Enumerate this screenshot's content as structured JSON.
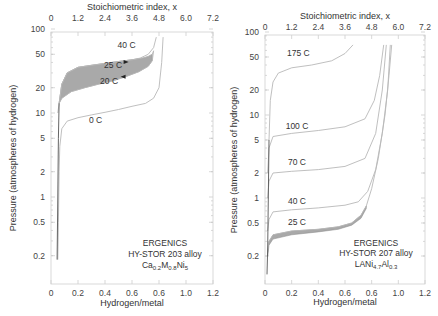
{
  "chart_data": [
    {
      "type": "line",
      "id": "left",
      "title": "",
      "top_xlabel": "Stoichiometric index, x",
      "top_xticks": [
        "0",
        "1.2",
        "2.4",
        "3.6",
        "4.8",
        "6.0",
        "7.2"
      ],
      "xlabel": "Hydrogen/metal",
      "xticks": [
        "0",
        "0.2",
        "0.4",
        "0.6",
        "0.6",
        "1.0",
        "1.2"
      ],
      "ylabel": "Pressure  (atmospheres of hydrogen)",
      "yticks": [
        "100",
        "50",
        "20",
        "10",
        "5",
        "2",
        "1",
        "0.5",
        "0.2"
      ],
      "yscale": "log",
      "xlim": [
        0,
        1.2
      ],
      "ylim": [
        0.1,
        100
      ],
      "annotation": {
        "line1": "ERGENICS",
        "line2": "HY-STOR 203 alloy",
        "formula": [
          {
            "t": "Ca",
            "sub": false
          },
          {
            "t": "0.2",
            "sub": true
          },
          {
            "t": "M",
            "sub": false
          },
          {
            "t": "0.8",
            "sub": true
          },
          {
            "t": "Ni",
            "sub": false
          },
          {
            "t": "5",
            "sub": true
          }
        ]
      },
      "series": [
        {
          "name": "40 C",
          "label_at": [
            0.56,
            60
          ],
          "points": [
            [
              0.06,
              13
            ],
            [
              0.08,
              22
            ],
            [
              0.12,
              30
            ],
            [
              0.2,
              35
            ],
            [
              0.3,
              37
            ],
            [
              0.4,
              39
            ],
            [
              0.5,
              41
            ],
            [
              0.6,
              43
            ],
            [
              0.66,
              45
            ],
            [
              0.72,
              50
            ],
            [
              0.76,
              60
            ],
            [
              0.78,
              80
            ]
          ]
        },
        {
          "name": "25 C (absorption)",
          "points": [
            [
              0.06,
              13
            ],
            [
              0.08,
              22
            ],
            [
              0.12,
              30
            ],
            [
              0.2,
              35
            ],
            [
              0.3,
              37
            ],
            [
              0.4,
              39
            ],
            [
              0.5,
              41
            ],
            [
              0.6,
              43
            ],
            [
              0.68,
              45
            ],
            [
              0.72,
              47
            ],
            [
              0.75,
              50
            ],
            [
              0.76,
              55
            ]
          ]
        },
        {
          "name": "25 C",
          "label_at": [
            0.46,
            34
          ],
          "band_with": "20 C"
        },
        {
          "name": "20 C",
          "label_at": [
            0.43,
            22
          ],
          "points": [
            [
              0.05,
              10
            ],
            [
              0.06,
              13
            ],
            [
              0.08,
              15
            ],
            [
              0.15,
              18
            ],
            [
              0.25,
              20
            ],
            [
              0.35,
              22
            ],
            [
              0.45,
              24
            ],
            [
              0.55,
              27
            ],
            [
              0.65,
              31
            ],
            [
              0.72,
              36
            ],
            [
              0.75,
              42
            ],
            [
              0.76,
              55
            ]
          ]
        },
        {
          "name": "0 C",
          "label_at": [
            0.33,
            7.5
          ],
          "points": [
            [
              0.05,
              0.18
            ],
            [
              0.055,
              0.5
            ],
            [
              0.06,
              2
            ],
            [
              0.065,
              4
            ],
            [
              0.08,
              6.5
            ],
            [
              0.12,
              8
            ],
            [
              0.2,
              8.8
            ],
            [
              0.3,
              9.5
            ],
            [
              0.4,
              10.2
            ],
            [
              0.5,
              11
            ],
            [
              0.6,
              12
            ],
            [
              0.7,
              13
            ],
            [
              0.76,
              15
            ],
            [
              0.8,
              20
            ],
            [
              0.82,
              40
            ],
            [
              0.83,
              80
            ]
          ]
        },
        {
          "name": "steep-left",
          "points": [
            [
              0.045,
              0.18
            ],
            [
              0.05,
              1
            ],
            [
              0.055,
              5
            ],
            [
              0.06,
              13
            ]
          ]
        }
      ]
    },
    {
      "type": "line",
      "id": "right",
      "title": "",
      "top_xlabel": "Stoichiometric index, x",
      "top_xticks": [
        "0",
        "1.2",
        "2.4",
        "3.6",
        "4.8",
        "6.0",
        "7.2"
      ],
      "xlabel": "Hydrogen/metal",
      "xticks": [
        "0",
        "0.2",
        "0.4",
        "0.6",
        "0.6",
        "1.0",
        "1.2"
      ],
      "ylabel": "Pressure  (atmospheres of hydrogen)",
      "yticks": [
        "100",
        "50",
        "20",
        "10",
        "5",
        "2",
        "1",
        "0.5",
        "0.2"
      ],
      "yscale": "log",
      "xlim": [
        0,
        1.2
      ],
      "ylim": [
        0.1,
        100
      ],
      "annotation": {
        "line1": "ERGENICS",
        "line2": "HY-STOR 207 alloy",
        "formula": [
          {
            "t": "LANi",
            "sub": false
          },
          {
            "t": "4.7",
            "sub": true
          },
          {
            "t": "Al",
            "sub": false
          },
          {
            "t": "0.3",
            "sub": true
          }
        ]
      },
      "series": [
        {
          "name": "175 C",
          "label_at": [
            0.25,
            52
          ],
          "points": [
            [
              0.03,
              5
            ],
            [
              0.04,
              15
            ],
            [
              0.06,
              25
            ],
            [
              0.1,
              32
            ],
            [
              0.2,
              37
            ],
            [
              0.35,
              40
            ],
            [
              0.5,
              45
            ],
            [
              0.6,
              55
            ],
            [
              0.66,
              70
            ]
          ]
        },
        {
          "name": "100 C",
          "label_at": [
            0.24,
            6.8
          ],
          "points": [
            [
              0.02,
              2
            ],
            [
              0.03,
              4
            ],
            [
              0.06,
              5.5
            ],
            [
              0.2,
              6
            ],
            [
              0.4,
              6.5
            ],
            [
              0.6,
              7.2
            ],
            [
              0.75,
              9
            ],
            [
              0.82,
              15
            ],
            [
              0.86,
              30
            ],
            [
              0.89,
              70
            ]
          ]
        },
        {
          "name": "70 C",
          "label_at": [
            0.24,
            2.5
          ],
          "points": [
            [
              0.02,
              1
            ],
            [
              0.03,
              1.6
            ],
            [
              0.06,
              2
            ],
            [
              0.2,
              2.1
            ],
            [
              0.4,
              2.2
            ],
            [
              0.6,
              2.4
            ],
            [
              0.75,
              3
            ],
            [
              0.83,
              6
            ],
            [
              0.88,
              20
            ],
            [
              0.91,
              70
            ]
          ]
        },
        {
          "name": "40 C",
          "label_at": [
            0.24,
            0.85
          ],
          "points": [
            [
              0.02,
              0.4
            ],
            [
              0.03,
              0.55
            ],
            [
              0.06,
              0.68
            ],
            [
              0.2,
              0.72
            ],
            [
              0.4,
              0.76
            ],
            [
              0.6,
              0.82
            ],
            [
              0.7,
              0.9
            ],
            [
              0.77,
              1.2
            ],
            [
              0.83,
              2.2
            ],
            [
              0.88,
              6
            ],
            [
              0.92,
              20
            ],
            [
              0.94,
              70
            ]
          ]
        },
        {
          "name": "25 C",
          "label_at": [
            0.24,
            0.47
          ],
          "band": true,
          "upper": [
            [
              0.02,
              0.22
            ],
            [
              0.03,
              0.3
            ],
            [
              0.06,
              0.36
            ],
            [
              0.2,
              0.4
            ],
            [
              0.4,
              0.42
            ],
            [
              0.55,
              0.45
            ],
            [
              0.65,
              0.5
            ],
            [
              0.72,
              0.62
            ],
            [
              0.76,
              0.8
            ],
            [
              0.8,
              1.3
            ],
            [
              0.85,
              3
            ],
            [
              0.9,
              10
            ],
            [
              0.93,
              30
            ],
            [
              0.95,
              70
            ]
          ],
          "lower": [
            [
              0.02,
              0.2
            ],
            [
              0.03,
              0.27
            ],
            [
              0.06,
              0.32
            ],
            [
              0.2,
              0.36
            ],
            [
              0.4,
              0.39
            ],
            [
              0.55,
              0.42
            ],
            [
              0.65,
              0.47
            ],
            [
              0.72,
              0.57
            ],
            [
              0.76,
              0.75
            ]
          ]
        },
        {
          "name": "steep-left",
          "points": [
            [
              0.015,
              0.12
            ],
            [
              0.02,
              0.25
            ],
            [
              0.025,
              1
            ],
            [
              0.03,
              5
            ]
          ]
        }
      ]
    }
  ],
  "left_band": {
    "upper": [
      [
        0.06,
        13
      ],
      [
        0.08,
        22
      ],
      [
        0.12,
        30
      ],
      [
        0.2,
        35
      ],
      [
        0.3,
        37
      ],
      [
        0.4,
        39
      ],
      [
        0.5,
        41
      ],
      [
        0.6,
        43
      ],
      [
        0.68,
        45
      ],
      [
        0.72,
        47
      ],
      [
        0.75,
        50
      ]
    ],
    "lower": [
      [
        0.06,
        13
      ],
      [
        0.08,
        15
      ],
      [
        0.15,
        18
      ],
      [
        0.25,
        20
      ],
      [
        0.35,
        22
      ],
      [
        0.45,
        24
      ],
      [
        0.55,
        27
      ],
      [
        0.65,
        31
      ],
      [
        0.72,
        36
      ],
      [
        0.75,
        42
      ]
    ]
  }
}
